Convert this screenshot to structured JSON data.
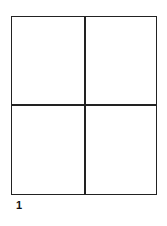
{
  "diagram": {
    "type": "grid",
    "rows": 2,
    "columns": 2,
    "line_color": "#222222",
    "background": "#ffffff",
    "cells": [
      {
        "row": 0,
        "col": 0,
        "content": ""
      },
      {
        "row": 0,
        "col": 1,
        "content": ""
      },
      {
        "row": 1,
        "col": 0,
        "content": ""
      },
      {
        "row": 1,
        "col": 1,
        "content": ""
      }
    ],
    "label": "1"
  }
}
